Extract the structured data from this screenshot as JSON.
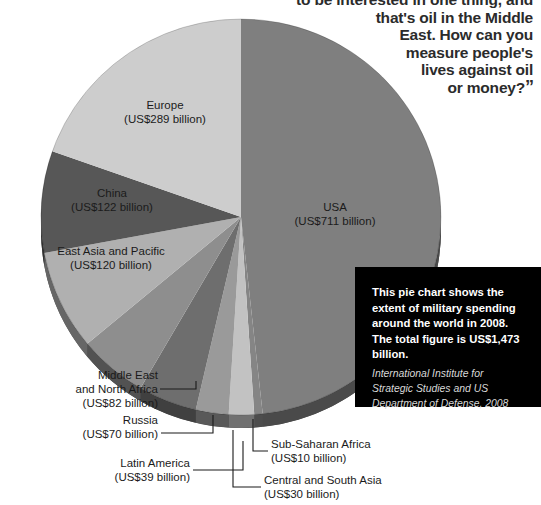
{
  "quote": {
    "text": "to be interested in one thing, and\nthat's oil in the Middle\nEast. How can you\nmeasure people's\nlives against oil\nor money?",
    "close_mark": "”"
  },
  "infobox": {
    "description": "This pie chart shows the extent of military spending around the world in 2008. The total figure is US$1,473 billion.",
    "source": "International Institute for Strategic Studies and US Department of Defense, 2008"
  },
  "chart_data": {
    "type": "pie",
    "title": "",
    "units": "US$ billion",
    "total": 1473,
    "total_label": "US$1,473 billion",
    "year": 2008,
    "legend": "none",
    "grid": false,
    "categories": [
      "USA",
      "Europe",
      "China",
      "East Asia and Pacific",
      "Middle East and North Africa",
      "Russia",
      "Latin America",
      "Central and South Asia",
      "Sub-Saharan Africa"
    ],
    "values": [
      711,
      289,
      122,
      120,
      82,
      70,
      39,
      30,
      10
    ],
    "colors": [
      "#7f7f7f",
      "#cdcdcd",
      "#575757",
      "#b0b0b0",
      "#8e8e8e",
      "#6e6e6e",
      "#9a9a9a",
      "#c2c2c2",
      "#858585"
    ],
    "slices": [
      {
        "name": "USA",
        "value": 711,
        "value_label": "(US$711 billion)",
        "label_pos": "inside"
      },
      {
        "name": "Europe",
        "value": 289,
        "value_label": "(US$289 billion)",
        "label_pos": "inside"
      },
      {
        "name": "China",
        "value": 122,
        "value_label": "(US$122 billion)",
        "label_pos": "inside"
      },
      {
        "name": "East Asia and Pacific",
        "value": 120,
        "value_label": "(US$120 billion)",
        "label_pos": "inside"
      },
      {
        "name": "Middle East\nand North Africa",
        "value": 82,
        "value_label": "(US$82 billion)",
        "label_pos": "callout"
      },
      {
        "name": "Russia",
        "value": 70,
        "value_label": "(US$70 billion)",
        "label_pos": "callout"
      },
      {
        "name": "Latin America",
        "value": 39,
        "value_label": "(US$39 billion)",
        "label_pos": "callout"
      },
      {
        "name": "Central and South Asia",
        "value": 30,
        "value_label": "(US$30 billion)",
        "label_pos": "callout"
      },
      {
        "name": "Sub-Saharan Africa",
        "value": 10,
        "value_label": "(US$10 billion)",
        "label_pos": "callout"
      }
    ]
  },
  "labels": {
    "usa": "USA\n(US$711 billion)",
    "europe": "Europe\n(US$289 billion)",
    "china": "China\n(US$122 billion)",
    "eap": "East Asia and Pacific\n(US$120 billion)",
    "mena": "Middle East\nand North Africa\n(US$82 billion)",
    "russia": "Russia\n(US$70 billion)",
    "latam": "Latin America\n(US$39 billion)",
    "ssa": "Sub-Saharan Africa\n(US$10 billion)",
    "csa": "Central and South Asia\n(US$30 billion)"
  }
}
